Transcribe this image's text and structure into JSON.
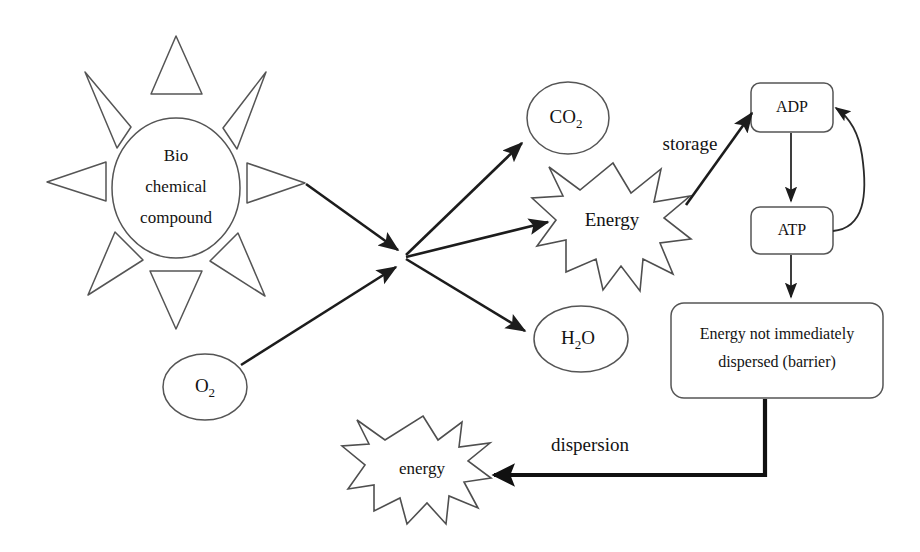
{
  "diagram": {
    "background_color": "#ffffff",
    "line_color": "#4a4a4a",
    "arrow_color": "#1c1c1c",
    "nodes": {
      "biochemical_compound": {
        "line1": "Bio",
        "line2": "chemical",
        "line3": "compound",
        "shape": "ellipse-with-sun-rays"
      },
      "oxygen": {
        "label": "O",
        "subscript": "2",
        "shape": "ellipse"
      },
      "carbon_dioxide": {
        "label": "CO",
        "subscript": "2",
        "shape": "ellipse"
      },
      "water": {
        "label": "H",
        "subscript": "2",
        "label2": "O",
        "shape": "ellipse"
      },
      "energy_burst": {
        "label": "Energy",
        "shape": "starburst"
      },
      "adp": {
        "label": "ADP",
        "shape": "rounded-rect"
      },
      "atp": {
        "label": "ATP",
        "shape": "rounded-rect"
      },
      "barrier": {
        "line1": "Energy not immediately",
        "line2": "dispersed (barrier)",
        "shape": "rounded-rect"
      },
      "energy_dispersed": {
        "label": "energy",
        "shape": "starburst"
      }
    },
    "edge_labels": {
      "storage": "storage",
      "dispersion": "dispersion"
    }
  }
}
